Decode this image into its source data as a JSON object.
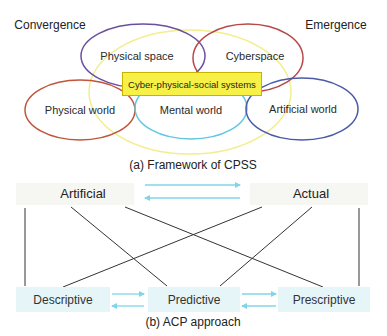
{
  "cpss": {
    "convergence": "Convergence",
    "emergence": "Emergence",
    "physical_space": "Physical space",
    "cyberspace": "Cyberspace",
    "center_label": "Cyber-physical-social systems",
    "physical_world": "Physical world",
    "mental_world": "Mental world",
    "artificial_world": "Artificial world",
    "caption": "(a) Framework of CPSS",
    "colors": {
      "physical_space": "#6a4fa0",
      "cyberspace": "#b8474a",
      "physical_world": "#c0553a",
      "mental_world": "#5fc8e0",
      "artificial_world": "#4a5aa8",
      "cpss_outer": "#f2ee8c",
      "center_box": "#f7f046"
    }
  },
  "acp": {
    "artificial": "Artificial",
    "actual": "Actual",
    "descriptive": "Descriptive",
    "predictive": "Predictive",
    "prescriptive": "Prescriptive",
    "caption": "(b) ACP approach",
    "arrow_color": "#7fd6e6",
    "node_bg": "#e6f5f8"
  }
}
